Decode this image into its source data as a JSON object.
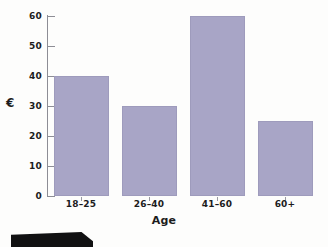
{
  "chart_data": {
    "type": "bar",
    "title": "",
    "subtitle": "",
    "xlabel": "Age",
    "ylabel": "€",
    "categories": [
      "18–25",
      "26–40",
      "41–60",
      "60+"
    ],
    "values": [
      40,
      30,
      60,
      25
    ],
    "series": [
      {
        "name": "",
        "values": [
          40,
          30,
          60,
          25
        ]
      }
    ],
    "ylim": [
      0,
      60
    ],
    "yticks": [
      0,
      10,
      20,
      30,
      40,
      50,
      60
    ],
    "ytick_labels": [
      "0",
      "10",
      "20",
      "30",
      "40",
      "50",
      "60"
    ],
    "grid": false,
    "legend": false,
    "legend_position": "none",
    "bar_color": "#a8a5c6",
    "axis_color": "#8d8d95",
    "text_color": "#1c1c1c",
    "background": "#fdfdfc"
  },
  "artifact": {
    "name": "page-edge-shadow",
    "color": "#111112"
  }
}
